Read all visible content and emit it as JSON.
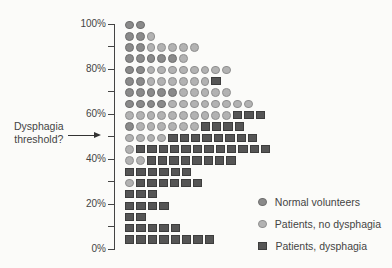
{
  "chart_data": {
    "type": "dot-plot",
    "title": "",
    "xlabel": "",
    "ylabel": "",
    "ylim": [
      0,
      100
    ],
    "y_ticks": [
      "0%",
      "20%",
      "40%",
      "60%",
      "80%",
      "100%"
    ],
    "annotation": {
      "text_line1": "Dysphagia",
      "text_line2": "threshold?",
      "points_to": "50%"
    },
    "legend": [
      {
        "key": "N",
        "label": "Normal volunteers",
        "marker": "dark circle"
      },
      {
        "key": "P",
        "label": "Patients, no dysphagia",
        "marker": "light circle"
      },
      {
        "key": "D",
        "label": "Patients, dysphagia",
        "marker": "dark square"
      }
    ],
    "bins_top_to_bottom": [
      {
        "approx_pct": 100,
        "N": 2,
        "P": 0,
        "D": 0
      },
      {
        "approx_pct": 95,
        "N": 2,
        "P": 1,
        "D": 0
      },
      {
        "approx_pct": 90,
        "N": 2,
        "P": 5,
        "D": 0
      },
      {
        "approx_pct": 85,
        "N": 5,
        "P": 1,
        "D": 0
      },
      {
        "approx_pct": 80,
        "N": 2,
        "P": 8,
        "D": 0
      },
      {
        "approx_pct": 75,
        "N": 2,
        "P": 6,
        "D": 1
      },
      {
        "approx_pct": 70,
        "N": 5,
        "P": 5,
        "D": 0
      },
      {
        "approx_pct": 65,
        "N": 4,
        "P": 8,
        "D": 0
      },
      {
        "approx_pct": 60,
        "N": 0,
        "P": 10,
        "D": 3
      },
      {
        "approx_pct": 55,
        "N": 1,
        "P": 6,
        "D": 4
      },
      {
        "approx_pct": 50,
        "N": 0,
        "P": 4,
        "D": 8
      },
      {
        "approx_pct": 45,
        "N": 0,
        "P": 1,
        "D": 12
      },
      {
        "approx_pct": 40,
        "N": 0,
        "P": 2,
        "D": 8
      },
      {
        "approx_pct": 35,
        "N": 0,
        "P": 0,
        "D": 6
      },
      {
        "approx_pct": 30,
        "N": 0,
        "P": 1,
        "D": 6
      },
      {
        "approx_pct": 25,
        "N": 0,
        "P": 0,
        "D": 3
      },
      {
        "approx_pct": 20,
        "N": 0,
        "P": 0,
        "D": 4
      },
      {
        "approx_pct": 15,
        "N": 0,
        "P": 0,
        "D": 2
      },
      {
        "approx_pct": 10,
        "N": 0,
        "P": 0,
        "D": 5
      },
      {
        "approx_pct": 5,
        "N": 0,
        "P": 0,
        "D": 8
      }
    ]
  },
  "axis": {
    "labels": [
      {
        "text": "100%",
        "y": 24
      },
      {
        "text": "80%",
        "y": 69
      },
      {
        "text": "60%",
        "y": 114
      },
      {
        "text": "40%",
        "y": 159
      },
      {
        "text": "20%",
        "y": 204
      },
      {
        "text": "0%",
        "y": 249
      }
    ],
    "minor_ticks_y": [
      46,
      91,
      136,
      181,
      226
    ]
  },
  "annotation": {
    "line1": "Dysphagia",
    "line2": "threshold?"
  },
  "legend": {
    "normal": "Normal volunteers",
    "no_dysphagia": "Patients, no dysphagia",
    "dysphagia": "Patients, dysphagia"
  }
}
